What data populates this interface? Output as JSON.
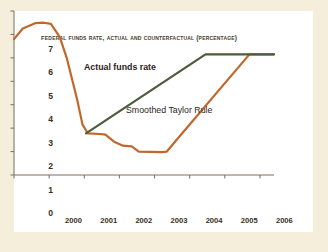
{
  "chart_data": {
    "type": "line",
    "title": "Federal funds rate, actual and counterfactual (percentage)",
    "xlabel": "",
    "ylabel": "",
    "xlim": [
      1999.5,
      2006.9
    ],
    "ylim": [
      0,
      7
    ],
    "yticks": [
      0,
      1,
      2,
      3,
      4,
      5,
      6,
      7
    ],
    "xticks": [
      2000,
      2001,
      2002,
      2003,
      2004,
      2005,
      2006
    ],
    "xtick_labels": [
      "2000",
      "2001",
      "2002",
      "2003",
      "2004",
      "2005",
      "2006"
    ],
    "grid": false,
    "legend_position": "inline-annotation",
    "series": [
      {
        "name": "Actual funds rate",
        "color": "#c2672b",
        "label_x": 2000.55,
        "label_y": 6.05,
        "points": [
          {
            "x": 1999.5,
            "y": 5.8
          },
          {
            "x": 1999.75,
            "y": 6.25
          },
          {
            "x": 2000.1,
            "y": 6.48
          },
          {
            "x": 2000.35,
            "y": 6.5
          },
          {
            "x": 2000.55,
            "y": 6.45
          },
          {
            "x": 2000.8,
            "y": 5.9
          },
          {
            "x": 2001.0,
            "y": 5.0
          },
          {
            "x": 2001.3,
            "y": 3.2
          },
          {
            "x": 2001.45,
            "y": 2.15
          },
          {
            "x": 2001.6,
            "y": 1.78
          },
          {
            "x": 2001.95,
            "y": 1.75
          },
          {
            "x": 2002.1,
            "y": 1.72
          },
          {
            "x": 2002.35,
            "y": 1.42
          },
          {
            "x": 2002.6,
            "y": 1.25
          },
          {
            "x": 2002.85,
            "y": 1.22
          },
          {
            "x": 2003.05,
            "y": 1.0
          },
          {
            "x": 2003.7,
            "y": 0.98
          },
          {
            "x": 2003.85,
            "y": 1.0
          },
          {
            "x": 2004.1,
            "y": 1.45
          },
          {
            "x": 2006.2,
            "y": 5.15
          },
          {
            "x": 2006.9,
            "y": 5.15
          }
        ]
      },
      {
        "name": "Smoothed Taylor Rule",
        "color": "#4c5b3c",
        "label_x": 2002.1,
        "label_y": 3.9,
        "points": [
          {
            "x": 2001.55,
            "y": 1.78
          },
          {
            "x": 2004.95,
            "y": 5.15
          },
          {
            "x": 2006.9,
            "y": 5.15
          }
        ]
      }
    ]
  },
  "colors": {
    "background": "#f4eeda",
    "panel": "#ffffff",
    "axis": "#7a6f5e",
    "text": "#3a2f24",
    "actual": "#c2672b",
    "taylor": "#4c5b3c"
  }
}
